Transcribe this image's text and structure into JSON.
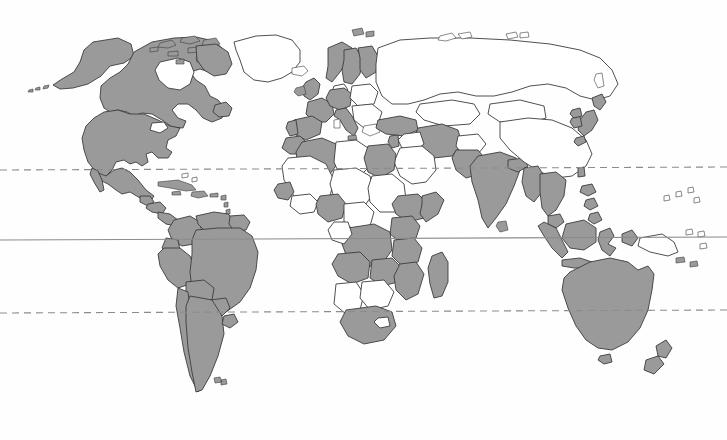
{
  "page": {
    "title": "World Map",
    "width": 727,
    "height": 440,
    "background_color": "#fefefe",
    "artifact_rule": {
      "name": "top-horizontal-rule",
      "color": "#b4b4b4",
      "description": "faint slightly-tilted horizontal scan rule near top of page"
    }
  },
  "map": {
    "type": "world-choropleth-binary",
    "projection": "equirectangular",
    "colors": {
      "shaded_fill": "#9a9a9a",
      "unshaded_fill": "#ffffff",
      "border_stroke": "#3c3c3c",
      "graticule_stroke": "#8c8c8c",
      "ocean": "#ffffff"
    },
    "legend": {
      "shaded_label": "Shaded country",
      "unshaded_label": "Unshaded country"
    },
    "graticule_lines": [
      {
        "name": "tropic-of-cancer",
        "label": "Tropic of Cancer",
        "latitude": 23.5,
        "y": 170,
        "style": "dashed"
      },
      {
        "name": "equator",
        "label": "Equator",
        "latitude": 0,
        "y": 240,
        "style": "solid"
      },
      {
        "name": "tropic-of-capricorn",
        "label": "Tropic of Capricorn",
        "latitude": -23.5,
        "y": 313,
        "style": "dashed"
      }
    ],
    "regions": [
      {
        "name": "north-america",
        "label": "North America",
        "shaded": true
      },
      {
        "name": "greenland",
        "label": "Greenland",
        "shaded": false
      },
      {
        "name": "central-america",
        "label": "Central America",
        "shaded": true
      },
      {
        "name": "caribbean",
        "label": "Caribbean",
        "shaded": true
      },
      {
        "name": "south-america",
        "label": "South America",
        "shaded": true
      },
      {
        "name": "western-europe",
        "label": "Western Europe",
        "shaded": true
      },
      {
        "name": "scandinavia",
        "label": "Scandinavia",
        "shaded": true
      },
      {
        "name": "eastern-europe",
        "label": "Eastern Europe",
        "shaded": false
      },
      {
        "name": "russia",
        "label": "Russia",
        "shaded": false
      },
      {
        "name": "north-africa",
        "label": "North Africa",
        "shaded": true
      },
      {
        "name": "sahel",
        "label": "Sahel",
        "shaded": false
      },
      {
        "name": "west-africa",
        "label": "West Africa",
        "shaded": true
      },
      {
        "name": "east-africa",
        "label": "East Africa",
        "shaded": true
      },
      {
        "name": "southern-africa",
        "label": "Southern Africa",
        "shaded": true
      },
      {
        "name": "middle-east",
        "label": "Middle East",
        "shaded": true
      },
      {
        "name": "arabian-peninsula",
        "label": "Arabian Peninsula",
        "shaded": false
      },
      {
        "name": "south-asia",
        "label": "South Asia",
        "shaded": true
      },
      {
        "name": "china",
        "label": "China",
        "shaded": false
      },
      {
        "name": "japan-korea",
        "label": "Japan and Korea",
        "shaded": true
      },
      {
        "name": "southeast-asia",
        "label": "Southeast Asia",
        "shaded": true
      },
      {
        "name": "indonesia",
        "label": "Indonesia",
        "shaded": true
      },
      {
        "name": "philippines",
        "label": "Philippines",
        "shaded": true
      },
      {
        "name": "papua-new-guinea",
        "label": "Papua New Guinea",
        "shaded": false
      },
      {
        "name": "australia",
        "label": "Australia",
        "shaded": true
      },
      {
        "name": "new-zealand",
        "label": "New Zealand",
        "shaded": true
      },
      {
        "name": "madagascar",
        "label": "Madagascar",
        "shaded": true
      }
    ]
  }
}
